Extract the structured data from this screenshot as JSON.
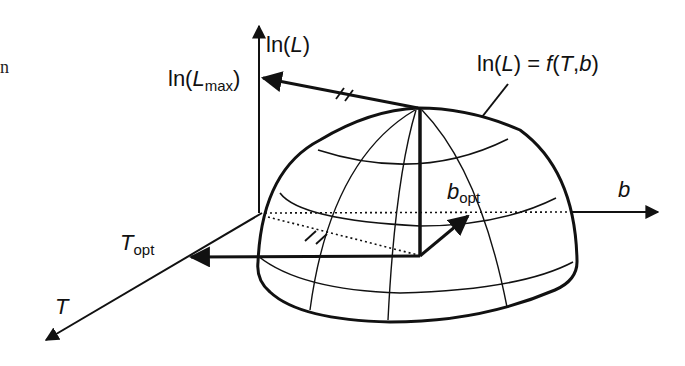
{
  "figure": {
    "left_fragment": "n",
    "axes": {
      "vertical": {
        "label_prefix": "ln(",
        "label_var": "L",
        "label_suffix": ")"
      },
      "horizontal": {
        "label": "b"
      },
      "depth": {
        "label": "T"
      }
    },
    "annotations": {
      "lmax": {
        "prefix": "ln(",
        "var": "L",
        "sub": "max",
        "suffix": ")"
      },
      "surface": {
        "prefix": "ln(",
        "var": "L",
        "mid": ") = ",
        "func": "f",
        "args_open": "(",
        "arg1": "T",
        "comma": ",",
        "arg2": "b",
        "args_close": ")"
      },
      "topt": {
        "var": "T",
        "sub": "opt"
      },
      "bopt": {
        "var": "b",
        "sub": "opt"
      }
    },
    "colors": {
      "ink": "#111111",
      "background": "#ffffff"
    }
  }
}
